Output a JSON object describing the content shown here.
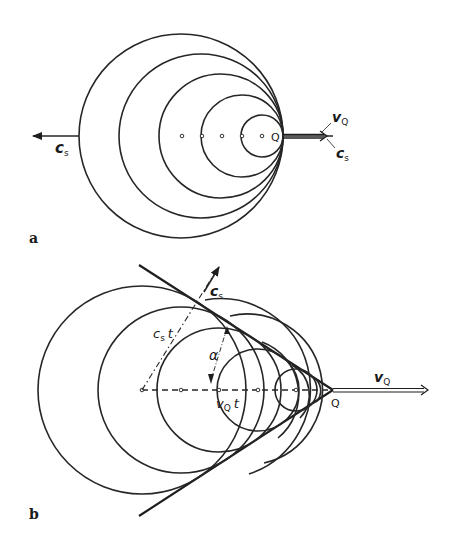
{
  "figure": {
    "panels": [
      {
        "id": "a",
        "letter": "a",
        "description": "Source Q moving slower than sound speed; wavefront circles nested, tangent-clustering ahead of source",
        "labels": {
          "left_velocity": "c",
          "left_velocity_sub": "s",
          "source": "Q",
          "source_velocity": "v",
          "source_velocity_sub": "Q",
          "right_velocity": "c",
          "right_velocity_sub": "s"
        }
      },
      {
        "id": "b",
        "letter": "b",
        "description": "Source Q moving faster than sound speed; wavefronts enveloped by Mach cone with half-angle alpha",
        "labels": {
          "wave_velocity": "c",
          "wave_velocity_sub": "s",
          "wave_distance": "c",
          "wave_distance_sub": "s",
          "wave_distance_t": "t",
          "angle": "α",
          "source_distance": "v",
          "source_distance_sub": "Q",
          "source_distance_t": "t",
          "source": "Q",
          "source_velocity": "v",
          "source_velocity_sub": "Q"
        }
      }
    ]
  }
}
